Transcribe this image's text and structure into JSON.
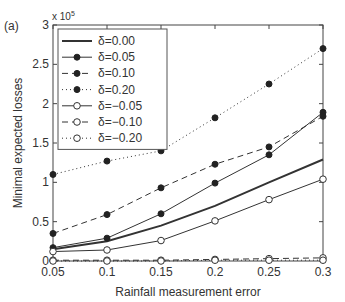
{
  "panel_label": "(a)",
  "y_multiplier": "x 10",
  "y_multiplier_exp": "5",
  "chart_data": {
    "type": "line",
    "title": "",
    "panel": "(a)",
    "xlabel": "Rainfall measurement error",
    "ylabel": "Minimal expected losses",
    "y_scale_note": "x 10^5",
    "xlim": [
      0.05,
      0.3
    ],
    "ylim": [
      0,
      3
    ],
    "x": [
      0.05,
      0.1,
      0.15,
      0.2,
      0.25,
      0.3
    ],
    "xticks": [
      "0.05",
      "0.1",
      "0.15",
      "0.2",
      "0.25",
      "0.3"
    ],
    "yticks": [
      "0",
      "0.5",
      "1",
      "1.5",
      "2",
      "2.5",
      "3"
    ],
    "grid": false,
    "legend_position": "upper left",
    "series": [
      {
        "name": "δ=0.00",
        "style": "solid-thick",
        "marker": "none",
        "values": [
          0.15,
          0.25,
          0.45,
          0.7,
          1.0,
          1.29
        ]
      },
      {
        "name": "δ=0.05",
        "style": "solid",
        "marker": "filled",
        "values": [
          0.17,
          0.29,
          0.6,
          0.99,
          1.35,
          1.89
        ]
      },
      {
        "name": "δ=0.10",
        "style": "dashed",
        "marker": "filled",
        "values": [
          0.35,
          0.59,
          0.93,
          1.23,
          1.45,
          1.84
        ]
      },
      {
        "name": "δ=0.20",
        "style": "dotted",
        "marker": "filled",
        "values": [
          1.1,
          1.27,
          1.4,
          1.82,
          2.25,
          2.7
        ]
      },
      {
        "name": "δ=−0.05",
        "style": "solid",
        "marker": "open",
        "values": [
          0.12,
          0.14,
          0.26,
          0.51,
          0.78,
          1.04
        ]
      },
      {
        "name": "δ=−0.10",
        "style": "dashed",
        "marker": "open",
        "values": [
          0.01,
          0.01,
          0.01,
          0.02,
          0.03,
          0.04
        ]
      },
      {
        "name": "δ=−0.20",
        "style": "dotted",
        "marker": "open",
        "values": [
          0.0,
          0.0,
          0.0,
          0.01,
          0.01,
          0.01
        ]
      }
    ]
  }
}
